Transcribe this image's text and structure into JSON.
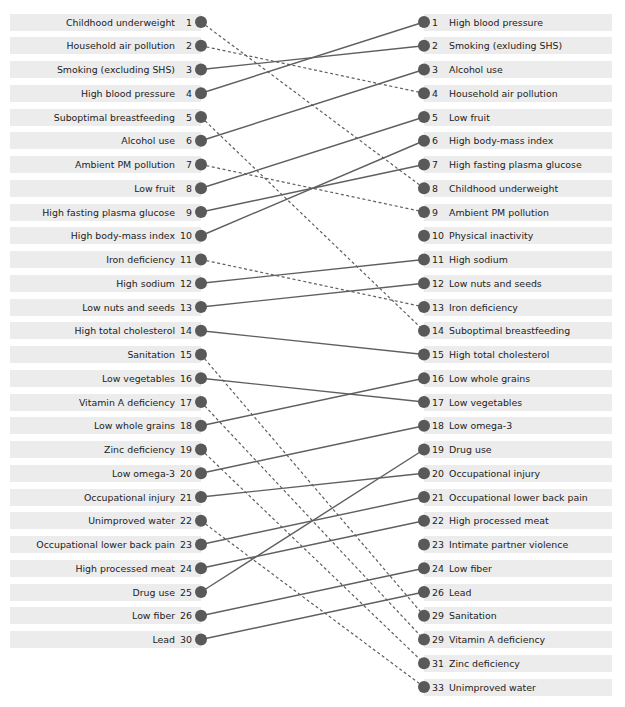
{
  "colors": {
    "dot": "#595959",
    "line": "#5f5f5f",
    "row_bg": "#ececec",
    "text": "#222222"
  },
  "layout": {
    "top": 22,
    "pitch": 23.75,
    "left_dot_x": 201,
    "right_dot_x": 424,
    "dot_r": 6
  },
  "chart_data": {
    "type": "slope / rank-change diagram",
    "title": "",
    "left_column": [
      {
        "rank": "1",
        "label": "Childhood underweight"
      },
      {
        "rank": "2",
        "label": "Household air pollution"
      },
      {
        "rank": "3",
        "label": "Smoking (excluding SHS)"
      },
      {
        "rank": "4",
        "label": "High blood pressure"
      },
      {
        "rank": "5",
        "label": "Suboptimal breastfeeding"
      },
      {
        "rank": "6",
        "label": "Alcohol use"
      },
      {
        "rank": "7",
        "label": "Ambient PM pollution"
      },
      {
        "rank": "8",
        "label": "Low fruit"
      },
      {
        "rank": "9",
        "label": "High fasting plasma glucose"
      },
      {
        "rank": "10",
        "label": "High body-mass index"
      },
      {
        "rank": "11",
        "label": "Iron deficiency"
      },
      {
        "rank": "12",
        "label": "High sodium"
      },
      {
        "rank": "13",
        "label": "Low nuts and seeds"
      },
      {
        "rank": "14",
        "label": "High total cholesterol"
      },
      {
        "rank": "15",
        "label": "Sanitation"
      },
      {
        "rank": "16",
        "label": "Low vegetables"
      },
      {
        "rank": "17",
        "label": "Vitamin A deficiency"
      },
      {
        "rank": "18",
        "label": "Low whole grains"
      },
      {
        "rank": "19",
        "label": "Zinc deficiency"
      },
      {
        "rank": "20",
        "label": "Low omega-3"
      },
      {
        "rank": "21",
        "label": "Occupational injury"
      },
      {
        "rank": "22",
        "label": "Unimproved water"
      },
      {
        "rank": "23",
        "label": "Occupational lower back pain"
      },
      {
        "rank": "24",
        "label": "High processed meat"
      },
      {
        "rank": "25",
        "label": "Drug use"
      },
      {
        "rank": "26",
        "label": "Low fiber"
      },
      {
        "rank": "30",
        "label": "Lead"
      }
    ],
    "right_column": [
      {
        "rank": "1",
        "label": "High blood pressure"
      },
      {
        "rank": "2",
        "label": "Smoking (exluding SHS)"
      },
      {
        "rank": "3",
        "label": "Alcohol use"
      },
      {
        "rank": "4",
        "label": "Household air pollution"
      },
      {
        "rank": "5",
        "label": "Low fruit"
      },
      {
        "rank": "6",
        "label": "High body-mass index"
      },
      {
        "rank": "7",
        "label": "High fasting plasma glucose"
      },
      {
        "rank": "8",
        "label": "Childhood underweight"
      },
      {
        "rank": "9",
        "label": "Ambient PM pollution"
      },
      {
        "rank": "10",
        "label": "Physical inactivity"
      },
      {
        "rank": "11",
        "label": "High sodium"
      },
      {
        "rank": "12",
        "label": "Low nuts and seeds"
      },
      {
        "rank": "13",
        "label": "Iron deficiency"
      },
      {
        "rank": "14",
        "label": "Suboptimal breastfeeding"
      },
      {
        "rank": "15",
        "label": "High total cholesterol"
      },
      {
        "rank": "16",
        "label": "Low whole grains"
      },
      {
        "rank": "17",
        "label": "Low vegetables"
      },
      {
        "rank": "18",
        "label": "Low omega-3"
      },
      {
        "rank": "19",
        "label": "Drug use"
      },
      {
        "rank": "20",
        "label": "Occupational injury"
      },
      {
        "rank": "21",
        "label": "Occupational lower back pain"
      },
      {
        "rank": "22",
        "label": "High processed meat"
      },
      {
        "rank": "23",
        "label": "Intimate partner violence"
      },
      {
        "rank": "24",
        "label": "Low fiber"
      },
      {
        "rank": "26",
        "label": "Lead"
      },
      {
        "rank": "29",
        "label": "Sanitation"
      },
      {
        "rank": "29",
        "label": "Vitamin A deficiency"
      },
      {
        "rank": "31",
        "label": "Zinc deficiency"
      },
      {
        "rank": "33",
        "label": "Unimproved water"
      }
    ],
    "links": [
      {
        "from": 0,
        "to": 7,
        "style": "dashed"
      },
      {
        "from": 1,
        "to": 3,
        "style": "dashed"
      },
      {
        "from": 2,
        "to": 1,
        "style": "solid"
      },
      {
        "from": 3,
        "to": 0,
        "style": "solid"
      },
      {
        "from": 4,
        "to": 13,
        "style": "dashed"
      },
      {
        "from": 5,
        "to": 2,
        "style": "solid"
      },
      {
        "from": 6,
        "to": 8,
        "style": "dashed"
      },
      {
        "from": 7,
        "to": 4,
        "style": "solid"
      },
      {
        "from": 8,
        "to": 6,
        "style": "solid"
      },
      {
        "from": 9,
        "to": 5,
        "style": "solid"
      },
      {
        "from": 10,
        "to": 12,
        "style": "dashed"
      },
      {
        "from": 11,
        "to": 10,
        "style": "solid"
      },
      {
        "from": 12,
        "to": 11,
        "style": "solid"
      },
      {
        "from": 13,
        "to": 14,
        "style": "solid"
      },
      {
        "from": 14,
        "to": 25,
        "style": "dashed"
      },
      {
        "from": 15,
        "to": 16,
        "style": "solid"
      },
      {
        "from": 16,
        "to": 26,
        "style": "dashed"
      },
      {
        "from": 17,
        "to": 15,
        "style": "solid"
      },
      {
        "from": 18,
        "to": 27,
        "style": "dashed"
      },
      {
        "from": 19,
        "to": 17,
        "style": "solid"
      },
      {
        "from": 20,
        "to": 19,
        "style": "solid"
      },
      {
        "from": 21,
        "to": 28,
        "style": "dashed"
      },
      {
        "from": 22,
        "to": 20,
        "style": "solid"
      },
      {
        "from": 23,
        "to": 21,
        "style": "solid"
      },
      {
        "from": 24,
        "to": 18,
        "style": "solid"
      },
      {
        "from": 25,
        "to": 23,
        "style": "solid"
      },
      {
        "from": 26,
        "to": 24,
        "style": "solid"
      }
    ],
    "legend": {
      "solid": "rank change (risk increased or kept)",
      "dashed": "rank fell"
    }
  }
}
